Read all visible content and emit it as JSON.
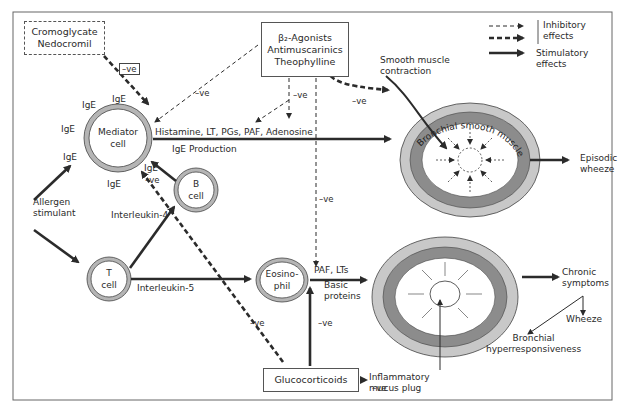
{
  "diagram": {
    "boxes": {
      "cromoglycate": [
        "Cromoglycate",
        "Nedocromil"
      ],
      "beta_agonists": [
        "β₂-Agonists",
        "Antimuscarinics",
        "Theophylline"
      ],
      "glucocorticoids": "Glucocorticoids"
    },
    "cells": {
      "mediator": [
        "Mediator",
        "cell"
      ],
      "b_cell": [
        "B",
        "cell"
      ],
      "t_cell": [
        "T",
        "cell"
      ],
      "eosinophil": [
        "Eosino-",
        "phil"
      ]
    },
    "ige_labels": [
      "IgE",
      "IgE",
      "IgE",
      "IgE",
      "IgE",
      "IgE",
      "IgE"
    ],
    "labels": {
      "allergen": [
        "Allergen",
        "stimulant"
      ],
      "mediators": "Histamine, LT, PGs, PAF, Adenosine",
      "ige_production": "IgE Production",
      "interleukin4": "Interleukin-4",
      "interleukin5": "Interleukin-5",
      "paf_lts": "PAF, LTs",
      "basic_proteins": [
        "Basic",
        "proteins"
      ],
      "smooth_muscle_contraction": [
        "Smooth muscle",
        "contraction"
      ],
      "bronchial_smooth_muscle": "Bronchial smooth muscle",
      "episodic_wheeze": [
        "Episodic",
        "wheeze"
      ],
      "chronic_symptoms": [
        "Chronic",
        "symptoms"
      ],
      "wheeze": "Wheeze",
      "bronchial_hyper": [
        "Bronchial",
        "hyperresponsiveness"
      ],
      "inflammatory_plug": [
        "Inflammatory",
        "mucus plug"
      ]
    },
    "negative_effect": "–ve",
    "legend": {
      "inhibitory": [
        "Inhibitory",
        "effects"
      ],
      "stimulatory": [
        "Stimulatory",
        "effects"
      ]
    },
    "colors": {
      "line": "#2b2b2b",
      "outer_ring": "#c8c8c8",
      "muscle_ring": "#8c8c8c",
      "cell_ring": "#b5b5b5"
    }
  }
}
